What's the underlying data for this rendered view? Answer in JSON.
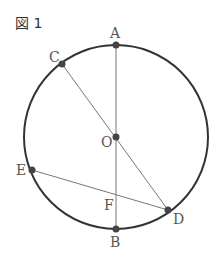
{
  "figure": {
    "title": "図 1",
    "circle": {
      "cx": 116,
      "cy": 137,
      "r": 92
    },
    "points": {
      "A": {
        "label": "A",
        "x": 116,
        "y": 45
      },
      "B": {
        "label": "B",
        "x": 116,
        "y": 229
      },
      "C": {
        "label": "C",
        "x": 62,
        "y": 64
      },
      "D": {
        "label": "D",
        "x": 168,
        "y": 210
      },
      "E": {
        "label": "E",
        "x": 32,
        "y": 170
      },
      "O": {
        "label": "O",
        "x": 116,
        "y": 137
      },
      "F": {
        "label": "F"
      }
    },
    "segments": [
      "AB",
      "CD",
      "ED"
    ]
  }
}
